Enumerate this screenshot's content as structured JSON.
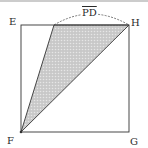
{
  "diagram": {
    "type": "geometry",
    "shape": "square with shaded triangle",
    "vertices": {
      "E": "top-left",
      "H": "top-right",
      "F": "bottom-left",
      "G": "bottom-right"
    },
    "labels": {
      "E": "E",
      "H": "H",
      "F": "F",
      "G": "G",
      "arc": "PD"
    },
    "shaded_region": "triangle P-H-F",
    "colors": {
      "stroke": "#333333",
      "shade": "#bdbdbd",
      "top_rule": "#9a9a9a"
    }
  }
}
